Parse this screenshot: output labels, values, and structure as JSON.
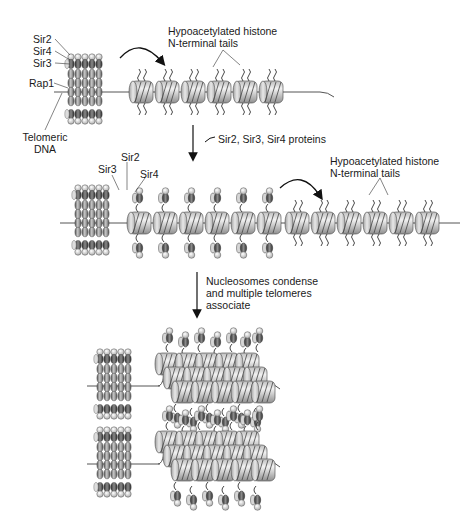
{
  "diagram": {
    "stage1": {
      "labels": {
        "sir2": "Sir2",
        "sir4": "Sir4",
        "sir3": "Sir3",
        "rap1": "Rap1",
        "telomeric_dna_line1": "Telomeric",
        "telomeric_dna_line2": "DNA",
        "tails_line1": "Hypoacetylated histone",
        "tails_line2": "N-terminal tails"
      },
      "nucleosome_count": 6
    },
    "step1": {
      "label": "Sir2, Sir3, Sir4 proteins"
    },
    "stage2": {
      "labels": {
        "sir2": "Sir2",
        "sir3": "Sir3",
        "sir4": "Sir4",
        "tails_line1": "Hypoacetylated histone",
        "tails_line2": "N-terminal tails"
      },
      "bound_nucleosome_count": 6,
      "free_nucleosome_count": 6
    },
    "step2": {
      "label_line1": "Nucleosomes condense",
      "label_line2": "and multiple telomeres",
      "label_line3": "associate"
    },
    "stage3": {
      "description": "Two condensed telomeric heterochromatin assemblies"
    },
    "colors": {
      "background": "#ffffff",
      "text": "#1a1a1a",
      "nucleosome_light": "#e6e6e6",
      "nucleosome_dark": "#8c8c8c",
      "protein_dark": "#4d4d4d",
      "protein_light": "#cfcfcf",
      "dna_line": "#555555"
    }
  }
}
